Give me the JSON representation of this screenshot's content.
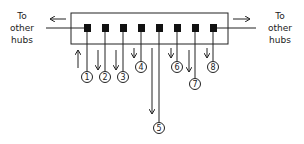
{
  "diagram": {
    "left_label": [
      "To",
      "other",
      "hubs"
    ],
    "right_label": [
      "To",
      "other",
      "hubs"
    ],
    "hub": {
      "x": 71,
      "y": 13,
      "width": 157,
      "height": 31
    },
    "ports": [
      {
        "id": "1",
        "x": 87,
        "circle_y": 75,
        "arrow": "up"
      },
      {
        "id": "2",
        "x": 105,
        "circle_y": 75,
        "arrow": "down"
      },
      {
        "id": "3",
        "x": 123,
        "circle_y": 75,
        "arrow": "down"
      },
      {
        "id": "4",
        "x": 141,
        "circle_y": 65,
        "arrow": "down"
      },
      {
        "id": "5",
        "x": 159,
        "circle_y": 128,
        "arrow": "down"
      },
      {
        "id": "6",
        "x": 177,
        "circle_y": 65,
        "arrow": "down"
      },
      {
        "id": "7",
        "x": 195,
        "circle_y": 82,
        "arrow": "down"
      },
      {
        "id": "8",
        "x": 213,
        "circle_y": 65,
        "arrow": "down"
      }
    ],
    "colors": {
      "line": "#222222",
      "fill": "#111111"
    }
  }
}
